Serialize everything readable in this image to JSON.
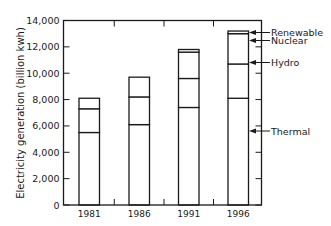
{
  "chart_data": {
    "type": "bar",
    "stacked": true,
    "title": "",
    "xlabel": "",
    "ylabel": "Electricity generation (billion kwh)",
    "ylim": [
      0,
      14000
    ],
    "yticks": [
      0,
      2000,
      4000,
      6000,
      8000,
      10000,
      12000,
      14000
    ],
    "ytick_labels": [
      "0",
      "2,000",
      "4,000",
      "6,000",
      "8,000",
      "10,000",
      "12,000",
      "14,000"
    ],
    "categories": [
      "1981",
      "1986",
      "1991",
      "1996"
    ],
    "series": [
      {
        "name": "Thermal",
        "values": [
          5500,
          6100,
          7400,
          8100
        ]
      },
      {
        "name": "Hydro",
        "values": [
          1800,
          2100,
          2200,
          2600
        ]
      },
      {
        "name": "Nuclear",
        "values": [
          800,
          1500,
          2000,
          2300
        ]
      },
      {
        "name": "Renewable",
        "values": [
          0,
          0,
          200,
          200
        ]
      }
    ],
    "totals": [
      8100,
      9700,
      11800,
      13200
    ],
    "legend": {
      "position": "right",
      "style": "arrow-labels",
      "entries": [
        "Renewable",
        "Nuclear",
        "Hydro",
        "Thermal"
      ]
    },
    "grid": false
  },
  "colors": {
    "bar_fill": "#ffffff",
    "stroke": "#1a1a1a",
    "background": "#ffffff"
  }
}
